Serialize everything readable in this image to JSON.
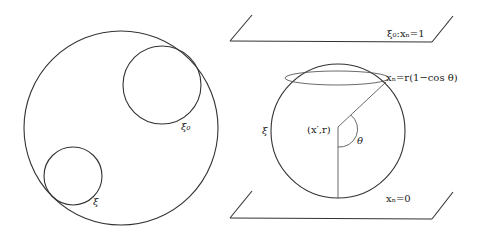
{
  "left_figure": {
    "labels": {
      "xi0": "ξ₀",
      "xi": "ξ"
    }
  },
  "right_figure": {
    "top_plane_label": "ξ₀:xₙ=1",
    "cap_label": "xₙ=r(1−cos θ)",
    "sphere_label": "ξ",
    "center_label": "(x′,r)",
    "angle_label": "θ",
    "bottom_plane_label": "xₙ=0"
  }
}
